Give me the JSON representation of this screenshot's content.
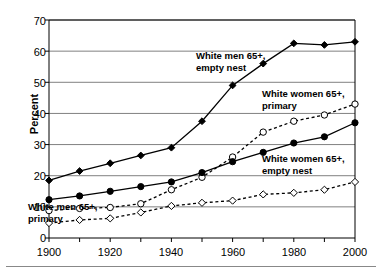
{
  "chart_data": {
    "type": "line",
    "title": "",
    "xlabel": "",
    "ylabel": "Percent",
    "xlim": [
      1900,
      2000
    ],
    "ylim": [
      0,
      70
    ],
    "ytick_values": [
      0,
      10,
      20,
      30,
      40,
      50,
      60,
      70
    ],
    "ytick_labels": [
      "0",
      "10",
      "20",
      "30",
      "40",
      "50",
      "60",
      "70"
    ],
    "xtick_values": [
      1900,
      1920,
      1940,
      1960,
      1980,
      2000
    ],
    "xtick_labels": [
      "1900",
      "1920",
      "1940",
      "1960",
      "1980",
      "2000"
    ],
    "xtick_minor": [
      1910,
      1930,
      1950,
      1970,
      1990
    ],
    "grid": "horizontal",
    "legend_position": "inline-annotations",
    "x": [
      1900,
      1910,
      1920,
      1930,
      1940,
      1950,
      1960,
      1970,
      1980,
      1990,
      2000
    ],
    "series": [
      {
        "name": "White men 65+, empty nest",
        "marker": "filled-diamond",
        "line": "solid",
        "values": [
          18.5,
          21.5,
          24,
          26.5,
          29,
          37.5,
          49,
          56,
          62.5,
          62,
          63
        ],
        "label_text": "White men 65+,\nempty nest",
        "label_x": 196,
        "label_y": 50
      },
      {
        "name": "White women 65+, primary",
        "marker": "open-circle",
        "line": "dashed",
        "values": [
          8.8,
          9.5,
          9.8,
          11,
          15.5,
          19.5,
          26,
          34,
          37.5,
          39.5,
          43
        ],
        "label_text": "White women 65+,\nprimary",
        "label_x": 262,
        "label_y": 88
      },
      {
        "name": "White women 65+, empty nest",
        "marker": "filled-circle",
        "line": "solid",
        "values": [
          12.3,
          13.5,
          15,
          16.5,
          18,
          21,
          24.5,
          27.5,
          30.5,
          32.5,
          37
        ],
        "label_text": "White women 65+,\nempty nest",
        "label_x": 262,
        "label_y": 153
      },
      {
        "name": "White men 65+, primary",
        "marker": "open-diamond",
        "line": "dashed",
        "values": [
          4.8,
          5.8,
          6.3,
          8.2,
          10.3,
          11.3,
          12,
          14,
          14.5,
          15.5,
          18
        ],
        "label_text": "White men 65+,\nprimary",
        "label_x": 28,
        "label_y": 201
      }
    ]
  }
}
